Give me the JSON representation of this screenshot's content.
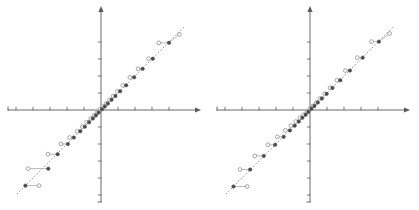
{
  "figure": {
    "title": "",
    "background": "#ffffff",
    "panel_count": 2,
    "width": 419,
    "height": 210
  },
  "colors": {
    "axis": "#5a5a5a",
    "reference_line": "#8a8a8a",
    "filled_marker": "#4a4a4a",
    "open_marker_stroke": "#8a8a8a",
    "open_marker_fill": "#ffffff",
    "connector": "#9a9a9a"
  },
  "chart_data": [
    {
      "type": "scatter",
      "title": "",
      "xlabel": "",
      "ylabel": "",
      "xlim": [
        -5.2,
        5.2
      ],
      "ylim": [
        -5.2,
        5.2
      ],
      "grid": false,
      "legend": "none",
      "axis_style": "crossed-arrows",
      "x_ticks": [
        -5,
        -4,
        -3,
        -2,
        -1,
        1,
        2,
        3,
        4
      ],
      "y_ticks": [
        -5,
        -4,
        -3,
        -2,
        -1,
        1,
        2,
        3,
        4
      ],
      "reference_line": {
        "style": "dashed",
        "slope": 1,
        "intercept": 0
      },
      "series": [
        {
          "name": "filled",
          "marker": "filled-circle",
          "x": [
            -4.45,
            -3.1,
            -2.55,
            -1.95,
            -1.6,
            -1.22,
            -0.95,
            -0.7,
            -0.48,
            -0.3,
            -0.14,
            0.05,
            0.22,
            0.4,
            0.62,
            0.85,
            1.12,
            1.48,
            1.95,
            2.45,
            3.05,
            4.0
          ],
          "y": [
            -4.45,
            -3.45,
            -2.6,
            -2.0,
            -1.62,
            -1.25,
            -0.98,
            -0.72,
            -0.5,
            -0.32,
            -0.15,
            0.04,
            0.2,
            0.38,
            0.6,
            0.82,
            1.1,
            1.45,
            1.92,
            2.42,
            3.02,
            3.95
          ]
        },
        {
          "name": "open",
          "marker": "open-circle",
          "x": [
            -3.65,
            -4.28,
            -3.12,
            -2.35,
            -1.85,
            -1.4,
            -1.1,
            -0.84,
            -0.6,
            -0.4,
            -0.22,
            -0.05,
            0.12,
            0.3,
            0.5,
            0.72,
            0.96,
            1.28,
            1.7,
            2.18,
            2.8,
            3.4,
            4.62
          ],
          "y": [
            -4.45,
            -3.45,
            -2.6,
            -2.0,
            -1.62,
            -1.25,
            -0.98,
            -0.72,
            -0.5,
            -0.32,
            -0.15,
            0.04,
            0.2,
            0.38,
            0.6,
            0.82,
            1.1,
            1.45,
            1.92,
            2.42,
            3.02,
            3.95,
            4.45
          ]
        }
      ],
      "connectors": "horizontal segments joining paired filled and open markers at equal y"
    },
    {
      "type": "scatter",
      "title": "",
      "xlabel": "",
      "ylabel": "",
      "xlim": [
        -5.2,
        5.2
      ],
      "ylim": [
        -5.2,
        5.2
      ],
      "grid": false,
      "legend": "none",
      "axis_style": "crossed-arrows",
      "x_ticks": [
        -5,
        -4,
        -3,
        -2,
        -1,
        1,
        2,
        3,
        4
      ],
      "y_ticks": [
        -5,
        -4,
        -3,
        -2,
        -1,
        1,
        2,
        3,
        4
      ],
      "reference_line": {
        "style": "dashed",
        "slope": 1,
        "intercept": 0
      },
      "series": [
        {
          "name": "filled",
          "marker": "filled-circle",
          "x": [
            -4.5,
            -3.52,
            -2.72,
            -2.05,
            -1.55,
            -1.18,
            -0.9,
            -0.66,
            -0.45,
            -0.26,
            -0.1,
            0.08,
            0.26,
            0.46,
            0.7,
            0.98,
            1.32,
            1.78,
            2.35,
            3.1,
            4.05
          ],
          "y": [
            -4.5,
            -3.5,
            -2.7,
            -2.05,
            -1.58,
            -1.2,
            -0.92,
            -0.68,
            -0.46,
            -0.28,
            -0.11,
            0.07,
            0.24,
            0.44,
            0.68,
            0.95,
            1.3,
            1.75,
            2.32,
            3.08,
            4.02
          ]
        },
        {
          "name": "open",
          "marker": "open-circle",
          "x": [
            -3.7,
            -4.12,
            -3.25,
            -2.48,
            -1.92,
            -1.45,
            -1.12,
            -0.84,
            -0.6,
            -0.38,
            -0.18,
            0.0,
            0.18,
            0.38,
            0.6,
            0.86,
            1.18,
            1.58,
            2.08,
            2.78,
            3.62,
            4.68
          ],
          "y": [
            -4.5,
            -3.5,
            -2.7,
            -2.05,
            -1.58,
            -1.2,
            -0.92,
            -0.68,
            -0.46,
            -0.28,
            -0.11,
            0.07,
            0.24,
            0.44,
            0.68,
            0.95,
            1.3,
            1.75,
            2.32,
            3.08,
            4.02,
            4.5
          ]
        }
      ],
      "connectors": "horizontal segments joining paired filled and open markers at equal y"
    }
  ]
}
